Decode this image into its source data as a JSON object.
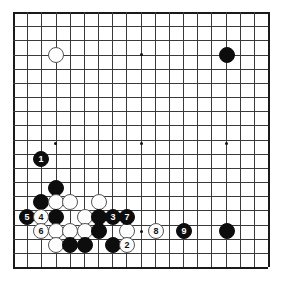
{
  "diagram": {
    "type": "go-board-diagram",
    "board_size": 19,
    "title": "",
    "background_color": "#ffffff",
    "line_color": "#3a3a3a",
    "edge_color": "#1a1a1a",
    "black_color": "#0d0d0d",
    "white_color": "#fdfdfd",
    "geometry": {
      "origin_x": 13,
      "origin_y": 12,
      "cell": 14.17,
      "stone_diameter": 16
    },
    "star_points": [
      {
        "x": 55,
        "y": 54
      },
      {
        "x": 141,
        "y": 54
      },
      {
        "x": 226,
        "y": 54
      },
      {
        "x": 55,
        "y": 143
      },
      {
        "x": 141,
        "y": 143
      },
      {
        "x": 226,
        "y": 143
      },
      {
        "x": 55,
        "y": 231
      },
      {
        "x": 141,
        "y": 231
      },
      {
        "x": 226,
        "y": 231
      }
    ],
    "stones": [
      {
        "id": "w-d16",
        "color": "white",
        "label": "",
        "x": 56,
        "y": 55
      },
      {
        "id": "b-q16",
        "color": "black",
        "label": "",
        "x": 227,
        "y": 55
      },
      {
        "id": "b-q4",
        "color": "black",
        "label": "",
        "x": 227,
        "y": 231
      },
      {
        "id": "b-move-1",
        "color": "black",
        "label": "1",
        "x": 41,
        "y": 159
      },
      {
        "id": "b-c7",
        "color": "black",
        "label": "",
        "x": 56,
        "y": 188
      },
      {
        "id": "b-b6",
        "color": "black",
        "label": "",
        "x": 41,
        "y": 202
      },
      {
        "id": "w-c6",
        "color": "white",
        "label": "",
        "x": 56,
        "y": 202
      },
      {
        "id": "w-d6",
        "color": "white",
        "label": "",
        "x": 70,
        "y": 202
      },
      {
        "id": "w-f6",
        "color": "white",
        "label": "",
        "x": 99,
        "y": 202
      },
      {
        "id": "b-move-5",
        "color": "black",
        "label": "5",
        "x": 27,
        "y": 217
      },
      {
        "id": "w-move-4",
        "color": "white",
        "label": "4",
        "x": 41,
        "y": 217
      },
      {
        "id": "b-c5",
        "color": "black",
        "label": "",
        "x": 56,
        "y": 217
      },
      {
        "id": "w-e5",
        "color": "white",
        "label": "",
        "x": 85,
        "y": 217
      },
      {
        "id": "b-f5",
        "color": "black",
        "label": "",
        "x": 99,
        "y": 217
      },
      {
        "id": "b-move-3",
        "color": "black",
        "label": "3",
        "x": 113,
        "y": 217
      },
      {
        "id": "b-move-7",
        "color": "black",
        "label": "7",
        "x": 127,
        "y": 217
      },
      {
        "id": "w-move-6",
        "color": "white",
        "label": "6",
        "x": 41,
        "y": 231
      },
      {
        "id": "w-c4",
        "color": "white",
        "label": "",
        "x": 56,
        "y": 231
      },
      {
        "id": "w-d4",
        "color": "white",
        "label": "",
        "x": 70,
        "y": 231
      },
      {
        "id": "w-e4",
        "color": "white",
        "label": "",
        "x": 85,
        "y": 231
      },
      {
        "id": "b-f4",
        "color": "black",
        "label": "",
        "x": 99,
        "y": 231
      },
      {
        "id": "w-h4",
        "color": "white",
        "label": "",
        "x": 127,
        "y": 231
      },
      {
        "id": "w-move-8",
        "color": "white",
        "label": "8",
        "x": 156,
        "y": 231
      },
      {
        "id": "b-move-9",
        "color": "black",
        "label": "9",
        "x": 184,
        "y": 231
      },
      {
        "id": "w-c3",
        "color": "white",
        "label": "",
        "x": 56,
        "y": 245
      },
      {
        "id": "b-d3",
        "color": "black",
        "label": "",
        "x": 70,
        "y": 245
      },
      {
        "id": "b-e3",
        "color": "black",
        "label": "",
        "x": 85,
        "y": 245
      },
      {
        "id": "b-g3",
        "color": "black",
        "label": "",
        "x": 113,
        "y": 245
      },
      {
        "id": "w-move-2",
        "color": "white",
        "label": "2",
        "x": 127,
        "y": 245
      }
    ]
  }
}
